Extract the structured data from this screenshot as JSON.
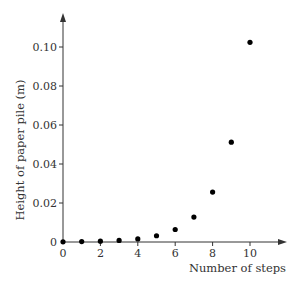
{
  "chart_data": {
    "type": "scatter",
    "title": "",
    "xlabel": "Number of steps",
    "ylabel": "Height of paper pile (m)",
    "xlim": [
      0,
      11.5
    ],
    "ylim": [
      0,
      0.115
    ],
    "x_ticks": [
      0,
      2,
      4,
      6,
      8,
      10
    ],
    "x_tick_labels": [
      "0",
      "2",
      "4",
      "6",
      "8",
      "10"
    ],
    "y_ticks": [
      0,
      0.02,
      0.04,
      0.06,
      0.08,
      0.1
    ],
    "y_tick_labels": [
      "0",
      "0.02",
      "0.04",
      "0.06",
      "0.08",
      "0.10"
    ],
    "grid": false,
    "legend": null,
    "series": [
      {
        "name": "Height",
        "x": [
          0,
          1,
          2,
          3,
          4,
          5,
          6,
          7,
          8,
          9,
          10
        ],
        "values": [
          0.0001,
          0.0002,
          0.0004,
          0.0008,
          0.0016,
          0.0032,
          0.0064,
          0.0128,
          0.0256,
          0.0512,
          0.1024
        ]
      }
    ],
    "colors": {
      "axis": "#333333",
      "marker": "#000000"
    }
  }
}
